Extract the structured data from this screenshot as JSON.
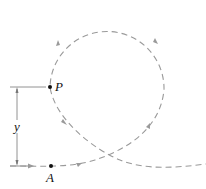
{
  "labels": {
    "point_p": "P",
    "point_a": "A",
    "dimension": "y"
  },
  "colors": {
    "path": "#999999",
    "dimension": "#666666",
    "point": "#111111"
  },
  "geometry": {
    "loop_center": [
      107,
      70
    ],
    "loop_radius": 57,
    "point_p": [
      50,
      87
    ],
    "point_a": [
      51,
      166
    ]
  }
}
